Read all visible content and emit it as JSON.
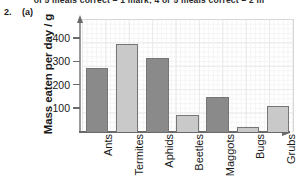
{
  "header": {
    "clipped_top_line": "of 5 meals correct = 1 mark; 4 or 5 meals correct = 2 m"
  },
  "question": {
    "number": "2.",
    "part": "(a)"
  },
  "chart_data": {
    "type": "bar",
    "title": "",
    "xlabel": "",
    "ylabel": "Mass eaten per day / g",
    "ylim": [
      0,
      490
    ],
    "yticks": [
      100,
      200,
      300,
      400
    ],
    "grid": true,
    "legend": "none",
    "categories": [
      "Ants",
      "Termites",
      "Aphids",
      "Beetles",
      "Maggots",
      "Bugs",
      "Grubs"
    ],
    "values": [
      275,
      380,
      320,
      75,
      150,
      20,
      110
    ],
    "bar_colors": [
      "#8a8a8a",
      "#c9c9c9",
      "#8a8a8a",
      "#c9c9c9",
      "#8a8a8a",
      "#c9c9c9",
      "#c9c9c9"
    ],
    "bar_border_color": "#767676",
    "axis_color": "#6a6a6a",
    "grid_color": "#e9e9e9"
  }
}
